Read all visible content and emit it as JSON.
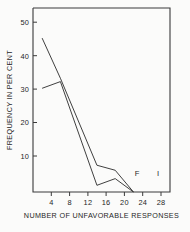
{
  "chart_data": {
    "type": "line",
    "title": "",
    "xlabel": "NUMBER OF UNFAVORABLE RESPONSES",
    "ylabel": "FREQUENCY IN PER CENT",
    "xlim": [
      0,
      30
    ],
    "ylim": [
      0,
      55
    ],
    "xticks": [
      4,
      8,
      12,
      16,
      20,
      24,
      28
    ],
    "yticks": [
      10,
      20,
      30,
      40,
      50
    ],
    "xtick_labels": [
      "4",
      "8",
      "12",
      "16",
      "20",
      "24",
      "28"
    ],
    "ytick_labels": [
      "10",
      "20",
      "30",
      "40",
      "50"
    ],
    "grid": false,
    "legend_position": "inline-right",
    "series": [
      {
        "name": "F",
        "label": "F",
        "x": [
          2,
          6,
          14,
          18,
          22
        ],
        "values": [
          46,
          34,
          8,
          6.5,
          0
        ]
      },
      {
        "name": "I",
        "label": "I",
        "x": [
          2,
          6,
          14,
          18,
          22
        ],
        "values": [
          31,
          33,
          2,
          4,
          0
        ]
      }
    ],
    "annotations": [
      {
        "text": "F",
        "x": 24,
        "y": 4
      },
      {
        "text": "I",
        "x": 28,
        "y": 4
      }
    ]
  },
  "figure": {
    "axis_color": "#3a3a3a",
    "line_color": "#2a2a2a",
    "background": "#fbfbfa"
  }
}
